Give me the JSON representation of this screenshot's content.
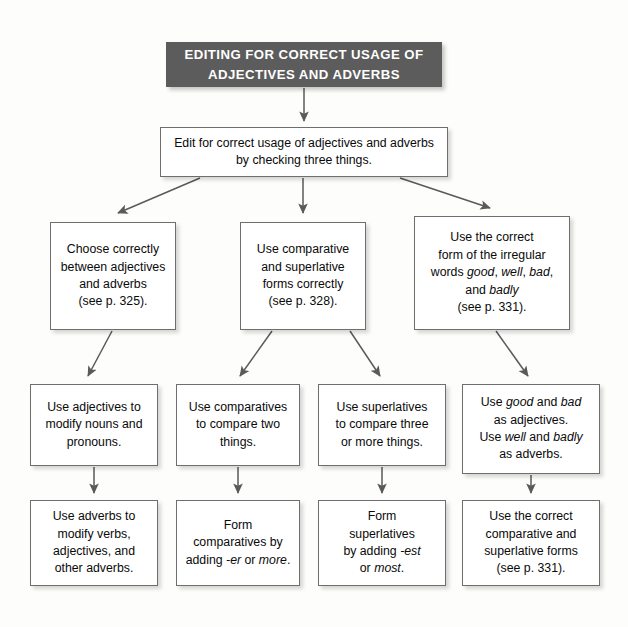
{
  "banner": {
    "title": "EDITING FOR CORRECT USAGE OF ADJECTIVES AND ADVERBS"
  },
  "nodes": {
    "root": "Edit for correct usage of adjectives and adverbs by checking three things.",
    "level2": [
      {
        "id": "choose-correctly",
        "html": "Choose correctly<br>between adjectives<br>and adverbs<br>(see p. 325).",
        "plain": "Choose correctly between adjectives and adverbs (see p. 325)."
      },
      {
        "id": "comparative-superlative",
        "html": "Use comparative<br>and superlative<br>forms correctly<br>(see p. 328).",
        "plain": "Use comparative and superlative forms correctly (see p. 328)."
      },
      {
        "id": "irregular-words",
        "html": "Use the correct<br>form of the irregular<br>words <i>good</i>, <i>well</i>, <i>bad</i>,<br>and <i>badly</i><br>(see p. 331).",
        "plain": "Use the correct form of the irregular words good, well, bad, and badly (see p. 331)."
      }
    ],
    "level3": [
      {
        "id": "adjectives-modify-nouns",
        "html": "Use adjectives to<br>modify nouns and<br>pronouns.",
        "plain": "Use adjectives to modify nouns and pronouns."
      },
      {
        "id": "comparatives-two-things",
        "html": "Use comparatives<br>to compare two<br>things.",
        "plain": "Use comparatives to compare two things."
      },
      {
        "id": "superlatives-three-things",
        "html": "Use superlatives<br>to compare three<br>or more things.",
        "plain": "Use superlatives to compare three or more things."
      },
      {
        "id": "good-bad-adjectives",
        "html": "Use <i>good</i> and <i>bad</i><br>as adjectives.<br>Use <i>well</i> and <i>badly</i><br>as adverbs.",
        "plain": "Use good and bad as adjectives. Use well and badly as adverbs."
      }
    ],
    "level4": [
      {
        "id": "adverbs-modify-verbs",
        "html": "Use adverbs to<br>modify verbs,<br>adjectives, and<br>other adverbs.",
        "plain": "Use adverbs to modify verbs, adjectives, and other adverbs."
      },
      {
        "id": "form-comparatives",
        "html": "Form<br>comparatives by<br>adding <i>-er</i> or <i>more</i>.",
        "plain": "Form comparatives by adding -er or more."
      },
      {
        "id": "form-superlatives",
        "html": "Form<br>superlatives<br>by adding <i>-est</i><br>or <i>most</i>.",
        "plain": "Form superlatives by adding -est or most."
      },
      {
        "id": "correct-comparative-superlative",
        "html": "Use the correct<br>comparative and<br>superlative forms<br>(see p. 331).",
        "plain": "Use the correct comparative and superlative forms (see p. 331)."
      }
    ]
  },
  "colors": {
    "banner_bg": "#5c5c5c",
    "banner_text": "#ffffff",
    "box_border": "#6e6e6e",
    "box_bg": "#ffffff",
    "connector": "#5a5a5a",
    "page_bg": "#fdfdfc"
  }
}
